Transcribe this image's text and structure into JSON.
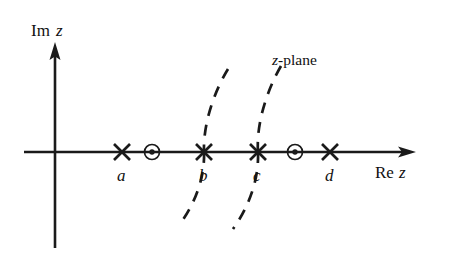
{
  "figure": {
    "kind": "complex-plane-diagram",
    "plane_label": {
      "variable": "z",
      "suffix": "-plane",
      "full": "z-plane"
    },
    "axes": {
      "imaginary": {
        "prefix": "Im",
        "variable": "z",
        "full": "Im z"
      },
      "real": {
        "prefix": "Re",
        "variable": "z",
        "full": "Re z"
      }
    },
    "markers": {
      "poles": [
        {
          "label": "a",
          "symbol": "cross"
        },
        {
          "label": "b",
          "symbol": "cross"
        },
        {
          "label": "c",
          "symbol": "cross"
        },
        {
          "label": "d",
          "symbol": "cross"
        }
      ],
      "zeros": [
        {
          "label": "",
          "symbol": "circled-dot"
        },
        {
          "label": "",
          "symbol": "circled-dot"
        }
      ]
    },
    "branch_cuts": {
      "count": 2,
      "style": "dashed",
      "passes_through": [
        "b",
        "c"
      ]
    },
    "colors": {
      "ink": "#1a1a1a",
      "background": "#ffffff"
    }
  }
}
